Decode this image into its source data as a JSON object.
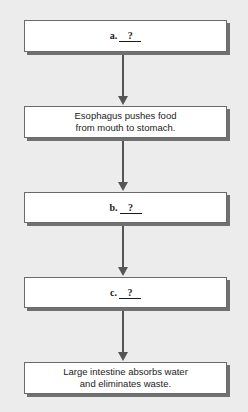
{
  "flowchart": {
    "title": "Digestive process flowchart",
    "steps": [
      {
        "letter": "a.",
        "blank": "?",
        "text": ""
      },
      {
        "letter": "",
        "blank": "",
        "text": "Esophagus pushes food from mouth to stomach."
      },
      {
        "letter": "b.",
        "blank": "?",
        "text": ""
      },
      {
        "letter": "c.",
        "blank": "?",
        "text": ""
      },
      {
        "letter": "",
        "blank": "",
        "text": "Large intestine absorbs water and eliminates waste."
      }
    ],
    "colors": {
      "background": "#ececec",
      "box_fill": "#ffffff",
      "border": "#6a6a6a",
      "shadow": "#707070",
      "arrow": "#555555"
    }
  }
}
